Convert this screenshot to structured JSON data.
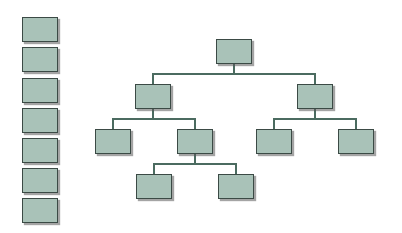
{
  "diagram": {
    "type": "org-chart",
    "colors": {
      "node_fill": "#a9c2b8",
      "node_border": "#3b4a45",
      "connector": "#4b6b60",
      "background": "#ffffff"
    },
    "legend_column": {
      "count": 7,
      "x": 22,
      "y": [
        17,
        47,
        78,
        108,
        138,
        168,
        198
      ]
    },
    "nodes": [
      {
        "id": "root",
        "x": 216,
        "y": 39
      },
      {
        "id": "l2-left",
        "x": 135,
        "y": 84
      },
      {
        "id": "l2-right",
        "x": 297,
        "y": 84
      },
      {
        "id": "l3-a",
        "x": 95,
        "y": 129
      },
      {
        "id": "l3-b",
        "x": 177,
        "y": 129
      },
      {
        "id": "l3-c",
        "x": 256,
        "y": 129
      },
      {
        "id": "l3-d",
        "x": 338,
        "y": 129
      },
      {
        "id": "l4-a",
        "x": 136,
        "y": 174
      },
      {
        "id": "l4-b",
        "x": 218,
        "y": 174
      }
    ]
  }
}
